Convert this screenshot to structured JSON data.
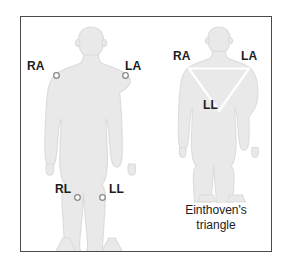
{
  "panel": {
    "border_color": "#4a4a4a",
    "background_color": "#ffffff"
  },
  "style": {
    "body_fill": "#e9e9e9",
    "body_stroke": "#dcdcdc",
    "electrode_stroke": "#8a8a8a",
    "electrode_fill": "#ffffff",
    "triangle_stroke": "#ffffff",
    "text_color": "#1c1c1c"
  },
  "figures": [
    {
      "id": "electrode-placement",
      "name": "electrode-placement-figure",
      "electrodes": [
        {
          "code": "RA",
          "name": "right-arm",
          "marker": "circle"
        },
        {
          "code": "LA",
          "name": "left-arm",
          "marker": "circle"
        },
        {
          "code": "RL",
          "name": "right-leg",
          "marker": "circle"
        },
        {
          "code": "LL",
          "name": "left-leg",
          "marker": "circle"
        }
      ]
    },
    {
      "id": "einthoven-triangle",
      "name": "einthoven-triangle-figure",
      "vertices": [
        {
          "code": "RA",
          "name": "right-arm",
          "position": "top-left"
        },
        {
          "code": "LA",
          "name": "left-arm",
          "position": "top-right"
        },
        {
          "code": "LL",
          "name": "left-leg",
          "position": "bottom-apex"
        }
      ],
      "caption_line1": "Einthoven's",
      "caption_line2": "triangle"
    }
  ],
  "labels": {
    "ra_left": "RA",
    "la_left": "LA",
    "rl_left": "RL",
    "ll_left": "LL",
    "ra_right": "RA",
    "la_right": "LA",
    "ll_right": "LL"
  },
  "caption": {
    "line1": "Einthoven's",
    "line2": "triangle"
  }
}
